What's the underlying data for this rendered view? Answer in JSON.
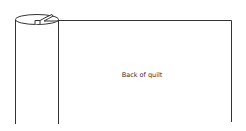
{
  "diagram": {
    "type": "quilt-roll-illustration",
    "labels": {
      "panel": "Back of quilt"
    },
    "colors": {
      "stroke": "#333333",
      "background": "#ffffff",
      "text": "#333333"
    },
    "shapes": {
      "roll": {
        "left_x": 16,
        "right_x": 58,
        "top_y": 19,
        "bottom_y": 124
      },
      "panel": {
        "left_x": 58,
        "right_x": 231,
        "top_y": 20,
        "bottom_y": 122
      }
    }
  }
}
